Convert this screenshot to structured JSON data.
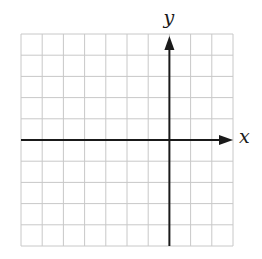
{
  "diagram": {
    "type": "coordinate-grid",
    "grid": {
      "columns": 10,
      "rows": 10,
      "left": 21,
      "top": 34,
      "cell_size": 21.2,
      "line_color": "#c8c8c8",
      "border_color": "#c8c8c8"
    },
    "axes": {
      "color": "#1a1a1a",
      "origin_column": 7,
      "origin_row": 5,
      "x_label": "x",
      "y_label": "y",
      "x_arrow": "right",
      "y_arrow": "up"
    }
  }
}
